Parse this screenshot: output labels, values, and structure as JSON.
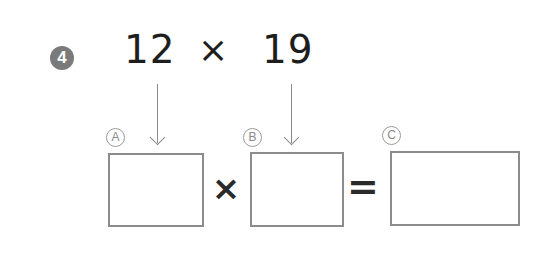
{
  "problem": {
    "number": "4",
    "factor_a": "12",
    "operator": "×",
    "factor_b": "19"
  },
  "equation": {
    "labels": [
      "A",
      "B",
      "C"
    ],
    "multiply_sign": "×",
    "equals_sign": "=",
    "boxes": [
      {
        "label": "A",
        "value": ""
      },
      {
        "label": "B",
        "value": ""
      },
      {
        "label": "C",
        "value": ""
      }
    ]
  },
  "colors": {
    "badge": "#7a7a7a",
    "text": "#1e1e1e",
    "box_border": "#8c8c8c"
  }
}
